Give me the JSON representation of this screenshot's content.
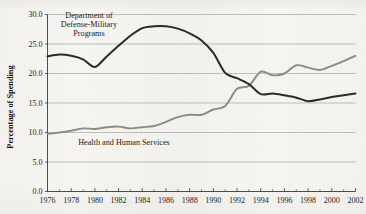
{
  "chart_data": {
    "type": "line",
    "title": "",
    "xlabel": "",
    "ylabel": "Percentage of Spending",
    "xlim": [
      1976,
      2002
    ],
    "ylim": [
      0.0,
      30.0
    ],
    "grid": "horizontal",
    "legend": "inline-annotations",
    "x": [
      1976,
      1977,
      1978,
      1979,
      1980,
      1981,
      1982,
      1983,
      1984,
      1985,
      1986,
      1987,
      1988,
      1989,
      1990,
      1991,
      1992,
      1993,
      1994,
      1995,
      1996,
      1997,
      1998,
      1999,
      2000,
      2001,
      2002
    ],
    "y_ticks": [
      "0.0",
      "5.0",
      "10.0",
      "15.0",
      "20.0",
      "25.0",
      "30.0"
    ],
    "y_tick_values": [
      0.0,
      5.0,
      10.0,
      15.0,
      20.0,
      25.0,
      30.0
    ],
    "x_ticks": [
      "1976",
      "1978",
      "1980",
      "1982",
      "1984",
      "1986",
      "1988",
      "1990",
      "1992",
      "1994",
      "1996",
      "1998",
      "2000",
      "2002"
    ],
    "x_tick_values": [
      1976,
      1978,
      1980,
      1982,
      1984,
      1986,
      1988,
      1990,
      1992,
      1994,
      1996,
      1998,
      2000,
      2002
    ],
    "x_minor_tick_values": [
      1977,
      1979,
      1981,
      1983,
      1985,
      1987,
      1989,
      1991,
      1993,
      1995,
      1997,
      1999,
      2001
    ],
    "series": [
      {
        "name": "Department of Defense-Military Programs",
        "label_lines": [
          "Department of",
          "Defense-Military",
          "Programs"
        ],
        "color": "#2b2b2b",
        "width": 2.0,
        "values": [
          22.9,
          23.2,
          23.0,
          22.4,
          21.1,
          22.9,
          24.7,
          26.4,
          27.7,
          28.0,
          28.0,
          27.6,
          26.8,
          25.6,
          23.5,
          20.1,
          19.2,
          18.2,
          16.5,
          16.6,
          16.3,
          15.9,
          15.3,
          15.6,
          16.0,
          16.3,
          16.6
        ]
      },
      {
        "name": "Health and Human Services",
        "label_lines": [
          "Health and Human Services"
        ],
        "color": "#8c8c88",
        "width": 1.9,
        "values": [
          9.8,
          10.0,
          10.3,
          10.7,
          10.6,
          10.9,
          11.0,
          10.7,
          10.9,
          11.1,
          11.8,
          12.6,
          13.0,
          13.0,
          13.9,
          14.5,
          17.4,
          17.9,
          20.3,
          19.7,
          20.0,
          21.4,
          21.0,
          20.6,
          21.3,
          22.1,
          23.0
        ]
      }
    ],
    "annotations": [
      {
        "name": "defense-series-label",
        "text_lines": [
          "Department of",
          "Defense-Military",
          "Programs"
        ],
        "x_px": 89,
        "y_px": 18,
        "align": "middle"
      },
      {
        "name": "hhs-series-label",
        "text_lines": [
          "Health and Human Services"
        ],
        "x_px": 124,
        "y_px": 145,
        "align": "middle"
      }
    ]
  }
}
